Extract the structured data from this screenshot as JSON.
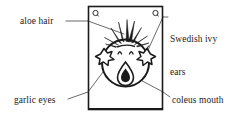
{
  "figure": {
    "background_color": "#ffffff",
    "ink_color": "#1b1b1b",
    "frame": {
      "name": "picture-frame",
      "x": 88,
      "y": 6,
      "width": 75,
      "height": 104,
      "border_color": "#1b1b1b"
    },
    "corner_marks": {
      "name": "garlic-bulb-corner-mark",
      "count": 2,
      "positions": [
        "top-left",
        "top-right"
      ]
    },
    "parts": [
      {
        "id": "aloe-hair",
        "name": "aloe hair spikes",
        "shape": "spiky-leaves"
      },
      {
        "id": "ivy-ears",
        "name": "Swedish ivy star ears",
        "shape": "star-leaf"
      },
      {
        "id": "garlic-eyes",
        "name": "garlic clove eyes",
        "shape": "arch"
      },
      {
        "id": "coleus-mouth",
        "name": "coleus leaf mouth",
        "shape": "teardrop"
      },
      {
        "id": "head",
        "name": "round head outline",
        "shape": "circle"
      }
    ]
  },
  "labels": {
    "aloe_hair": {
      "text": "aloe hair",
      "lines": [
        "aloe hair"
      ]
    },
    "swedish_ivy": {
      "text": "Swedish ivy\nears",
      "line1": "Swedish ivy",
      "line2": "ears"
    },
    "garlic_eyes": {
      "text": "garlic eyes",
      "lines": [
        "garlic eyes"
      ]
    },
    "coleus_mouth": {
      "text": "coleus mouth",
      "lines": [
        "coleus mouth"
      ]
    }
  },
  "leader_lines": [
    {
      "name": "leader-aloe-hair",
      "from": "aloe hair label",
      "to": "aloe hair spikes"
    },
    {
      "name": "leader-swedish-ivy",
      "from": "Swedish ivy label",
      "to": "right star ear"
    },
    {
      "name": "leader-garlic-eyes",
      "from": "garlic eyes label",
      "to": "left eye"
    },
    {
      "name": "leader-coleus-mouth",
      "from": "coleus mouth label",
      "to": "mouth"
    }
  ]
}
